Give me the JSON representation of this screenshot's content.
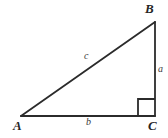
{
  "diagram": {
    "kind": "right-triangle-geometry-diagram",
    "background_color": "#ffffff",
    "stroke_color": "#2b2b2b",
    "label_color": "#262626",
    "side_label_color": "#3a3a3a",
    "vertices": [
      {
        "id": "A",
        "label": "A",
        "x": 21,
        "y": 116
      },
      {
        "id": "B",
        "label": "B",
        "x": 155,
        "y": 22
      },
      {
        "id": "C",
        "label": "C",
        "x": 155,
        "y": 116
      }
    ],
    "sides": [
      {
        "id": "a",
        "label": "a",
        "from": "B",
        "to": "C",
        "role": "opposite-leg-vertical"
      },
      {
        "id": "b",
        "label": "b",
        "from": "A",
        "to": "C",
        "role": "adjacent-leg-horizontal"
      },
      {
        "id": "c",
        "label": "c",
        "from": "A",
        "to": "B",
        "role": "hypotenuse"
      }
    ],
    "right_angle": {
      "at_vertex": "C",
      "marker": "square",
      "size": 17
    }
  }
}
